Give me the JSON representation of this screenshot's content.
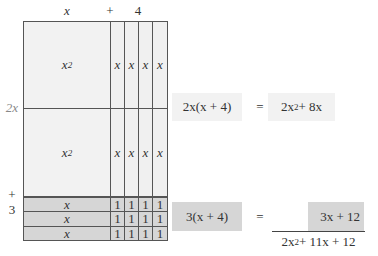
{
  "top_labels": {
    "x": "x",
    "plus": "+",
    "four": "4"
  },
  "side_labels": {
    "two_x": "2x",
    "plus": "+",
    "three": "3"
  },
  "grid": {
    "square_label": "x",
    "square_exp": "2",
    "x_tile": "x",
    "one_tile": "1",
    "x_row_label": "x"
  },
  "equations": [
    {
      "lhs": "2x(x + 4)",
      "eq": "=",
      "rhs_base": "2x",
      "rhs_exp": "2",
      "rhs_rest": " + 8x"
    },
    {
      "lhs": "3(x + 4)",
      "eq": "=",
      "rhs": "3x + 12"
    }
  ],
  "sum": {
    "base": "2x",
    "exp": "2",
    "rest": " + 11x + 12"
  },
  "colors": {
    "light": "#f2f2f2",
    "dark": "#d6d6d6",
    "line": "#555555"
  }
}
